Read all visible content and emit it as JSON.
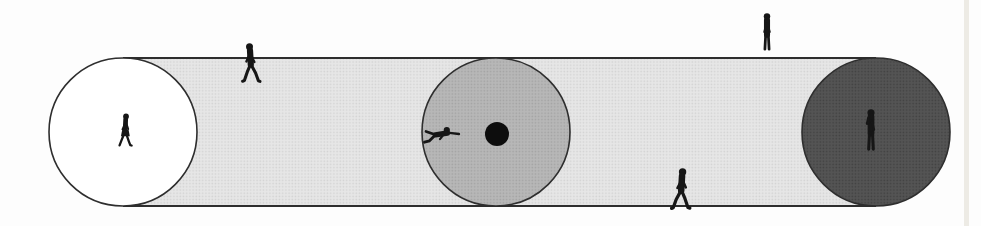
{
  "illustration": {
    "description": "Book diagram of a long stippled path band with three tangent circular goal areas and small walking-figure silhouettes; the middle gray circle contains a black target dot that a prone figure reaches toward.",
    "background_color": "#fdfdfd",
    "figure_color": "#161616",
    "outline_color": "#2e2e2e",
    "canvas": {
      "width": 981,
      "height": 226
    },
    "band": {
      "x1": 123,
      "x2": 876,
      "top": 58,
      "bottom": 206,
      "edge_width": 1.8,
      "texture": {
        "base": "#e6e6e6",
        "dot": "#d2d2d2"
      }
    },
    "circles": [
      {
        "name": "left-goal-circle",
        "cx": 123,
        "cy": 132,
        "r": 74,
        "fill": "#ffffff",
        "texture": null
      },
      {
        "name": "middle-goal-circle",
        "cx": 496,
        "cy": 132,
        "r": 74,
        "fill": null,
        "texture": {
          "base": "#b7b7b7",
          "dot": "#a2a2a2"
        }
      },
      {
        "name": "right-goal-circle",
        "cx": 876,
        "cy": 132,
        "r": 74,
        "fill": null,
        "texture": {
          "base": "#545454",
          "dot": "#414141"
        }
      }
    ],
    "target_dot": {
      "name": "target-dot",
      "cx": 497,
      "cy": 134,
      "r": 12,
      "fill": "#0d0d0d"
    },
    "people": [
      {
        "name": "walker-in-white-circle",
        "pose": "walk-skirt",
        "x": 125,
        "y": 146,
        "scale": 0.85,
        "flip": 1
      },
      {
        "name": "walker-on-top-edge",
        "pose": "walk",
        "x": 251,
        "y": 82,
        "scale": 1.0,
        "flip": -1
      },
      {
        "name": "reacher-in-middle-circle",
        "pose": "reach",
        "x": 459,
        "y": 134,
        "scale": 1.0,
        "flip": 1
      },
      {
        "name": "walker-on-bottom-edge",
        "pose": "walk",
        "x": 681,
        "y": 209,
        "scale": 1.05,
        "flip": 1
      },
      {
        "name": "stander-above-top-edge",
        "pose": "stand",
        "x": 767,
        "y": 50,
        "scale": 0.95,
        "flip": 1
      },
      {
        "name": "stander-in-dark-circle",
        "pose": "stand-arm-up",
        "x": 871,
        "y": 150,
        "scale": 1.05,
        "flip": -1
      }
    ],
    "page_edge_strip": {
      "x": 964,
      "width": 5,
      "color": "#cfc9b8",
      "opacity": 0.35
    }
  }
}
